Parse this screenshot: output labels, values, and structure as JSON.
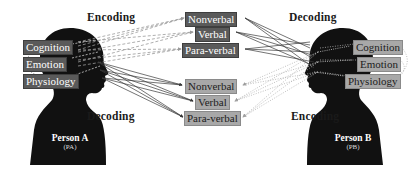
{
  "headings": {
    "top_left": "Encoding",
    "top_right": "Decoding",
    "bottom_left": "Decoding",
    "bottom_right": "Encoding"
  },
  "person_a": {
    "name": "Person A",
    "abbr": "(PA)",
    "states": [
      "Cognition",
      "Emotion",
      "Physiology"
    ]
  },
  "person_b": {
    "name": "Person B",
    "abbr": "(PB)",
    "states": [
      "Cognition",
      "Emotion",
      "Physiology"
    ]
  },
  "channels_top": [
    "Nonverbal",
    "Verbal",
    "Para-verbal"
  ],
  "channels_bottom": [
    "Nonverbal",
    "Verbal",
    "Para-verbal"
  ],
  "colors": {
    "silhouette": "#111111",
    "dark_box": "#5a5a5a",
    "light_box": "#a8a8a8",
    "solid_line": "#3a3a3a",
    "dashed_line": "#9a9a9a",
    "dotted_line": "#b0b0b0"
  }
}
